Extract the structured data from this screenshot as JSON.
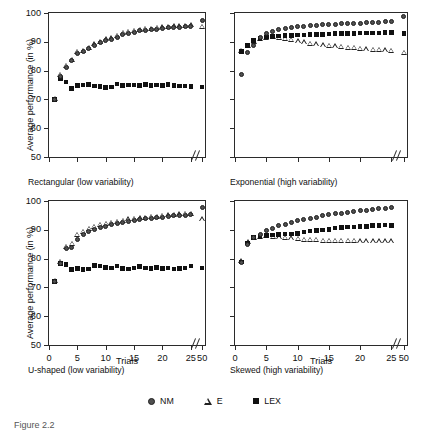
{
  "figure": {
    "caption": "Figure 2.2",
    "ylabel": "Average performance (in %)",
    "xlabel": "Trials"
  },
  "legend": {
    "position": "bottom-center",
    "items": [
      {
        "label": "NM",
        "marker": "filled-circle-icon"
      },
      {
        "label": "E",
        "marker": "open-triangle-icon"
      },
      {
        "label": "LEX",
        "marker": "filled-square-icon"
      }
    ]
  },
  "axes": {
    "ylim": [
      50,
      100
    ],
    "yticks": [
      50,
      60,
      70,
      80,
      90,
      100
    ],
    "yticklabels": [
      "50",
      "60",
      "70",
      "80",
      "90",
      "100"
    ],
    "xlim": [
      0,
      27.5
    ],
    "xticks": [
      0,
      5,
      10,
      15,
      20,
      25,
      27
    ],
    "xticklabels": [
      "0",
      "5",
      "10",
      "15",
      "20",
      "25",
      "50"
    ],
    "axis_break": true,
    "grid": false
  },
  "chart_data": [
    {
      "type": "scatter",
      "title": "Rectangular (low variability)",
      "panel": "top-left",
      "xlabel": "Trials",
      "ylabel": "Average performance (in %)",
      "ylim": [
        50,
        100
      ],
      "xticklabels": [
        "0",
        "5",
        "10",
        "15",
        "20",
        "25",
        "50"
      ],
      "x": [
        1,
        2,
        3,
        4,
        5,
        6,
        7,
        8,
        9,
        10,
        11,
        12,
        13,
        14,
        15,
        16,
        17,
        18,
        19,
        20,
        21,
        22,
        23,
        24,
        25,
        50
      ],
      "series": [
        {
          "name": "NM",
          "marker": "filled-circle",
          "values": [
            69.9,
            78.0,
            81.2,
            83.4,
            86.0,
            86.5,
            87.6,
            88.7,
            89.6,
            90.4,
            90.8,
            91.6,
            92.6,
            93.0,
            93.4,
            93.8,
            94.0,
            94.2,
            94.4,
            94.6,
            94.8,
            95.0,
            95.0,
            95.2,
            95.3,
            97.3
          ]
        },
        {
          "name": "E",
          "marker": "open-triangle",
          "values": [
            69.9,
            78.2,
            81.5,
            83.6,
            86.2,
            86.7,
            87.8,
            88.9,
            89.8,
            90.6,
            91.0,
            91.8,
            92.8,
            93.2,
            93.6,
            94.0,
            94.2,
            94.4,
            94.6,
            94.8,
            95.0,
            95.2,
            95.2,
            95.4,
            95.5,
            95.0
          ]
        },
        {
          "name": "LEX",
          "marker": "filled-square",
          "values": [
            69.9,
            77.3,
            76.0,
            73.8,
            74.8,
            75.0,
            75.1,
            74.6,
            74.4,
            74.2,
            74.3,
            75.3,
            74.8,
            75.0,
            75.0,
            74.9,
            75.1,
            74.8,
            75.0,
            74.9,
            75.1,
            74.8,
            74.6,
            74.6,
            74.5,
            74.3
          ]
        }
      ]
    },
    {
      "type": "scatter",
      "title": "Exponential (high variability)",
      "panel": "top-right",
      "xlabel": "Trials",
      "ylim": [
        50,
        100
      ],
      "xticklabels": [
        "0",
        "5",
        "10",
        "15",
        "20",
        "25",
        "50"
      ],
      "x": [
        1,
        2,
        3,
        4,
        5,
        6,
        7,
        8,
        9,
        10,
        11,
        12,
        13,
        14,
        15,
        16,
        17,
        18,
        19,
        20,
        21,
        22,
        23,
        24,
        25,
        50
      ],
      "series": [
        {
          "name": "NM",
          "marker": "filled-circle",
          "values": [
            78.6,
            86.3,
            88.8,
            91.4,
            92.8,
            93.6,
            94.2,
            94.6,
            95.0,
            95.2,
            95.4,
            95.6,
            95.8,
            95.9,
            96.0,
            96.1,
            96.2,
            96.3,
            96.4,
            96.5,
            96.6,
            96.7,
            96.8,
            96.9,
            97.0,
            98.8
          ]
        },
        {
          "name": "E",
          "marker": "open-triangle",
          "values": [
            86.5,
            88.5,
            89.8,
            90.8,
            91.2,
            91.4,
            91.2,
            90.8,
            90.4,
            90.0,
            89.6,
            89.2,
            88.9,
            88.6,
            88.4,
            88.2,
            88.0,
            87.8,
            87.6,
            87.4,
            87.2,
            87.0,
            86.9,
            86.8,
            86.7,
            86.0
          ]
        },
        {
          "name": "LEX",
          "marker": "filled-square",
          "values": [
            86.6,
            88.8,
            90.4,
            91.2,
            91.6,
            91.8,
            92.0,
            92.1,
            92.2,
            92.3,
            92.4,
            92.5,
            92.6,
            92.6,
            92.7,
            92.8,
            92.8,
            92.9,
            92.9,
            93.0,
            93.0,
            93.1,
            93.1,
            93.2,
            93.2,
            92.9
          ]
        }
      ]
    },
    {
      "type": "scatter",
      "title": "U-shaped (low variability)",
      "panel": "bottom-left",
      "xlabel": "Trials",
      "ylabel": "Average performance (in %)",
      "ylim": [
        50,
        100
      ],
      "xticklabels": [
        "0",
        "5",
        "10",
        "15",
        "20",
        "25",
        "50"
      ],
      "x": [
        1,
        2,
        3,
        4,
        5,
        6,
        7,
        8,
        9,
        10,
        11,
        12,
        13,
        14,
        15,
        16,
        17,
        18,
        19,
        20,
        21,
        22,
        23,
        24,
        25,
        50
      ],
      "series": [
        {
          "name": "NM",
          "marker": "filled-circle",
          "values": [
            72.0,
            78.4,
            83.4,
            84.0,
            86.8,
            88.2,
            89.4,
            90.2,
            90.8,
            91.2,
            91.8,
            92.2,
            92.6,
            93.0,
            93.4,
            93.6,
            93.8,
            94.0,
            94.2,
            94.4,
            94.6,
            94.8,
            95.0,
            95.1,
            95.2,
            97.7
          ]
        },
        {
          "name": "E",
          "marker": "open-triangle",
          "values": [
            72.0,
            78.6,
            83.8,
            85.0,
            88.0,
            89.0,
            90.2,
            90.8,
            91.4,
            91.8,
            92.2,
            92.6,
            93.0,
            93.4,
            93.6,
            93.8,
            94.0,
            94.2,
            94.4,
            94.6,
            94.8,
            95.0,
            95.2,
            95.3,
            95.4,
            93.4
          ]
        },
        {
          "name": "LEX",
          "marker": "filled-square",
          "values": [
            72.0,
            78.4,
            78.0,
            76.2,
            76.6,
            76.2,
            76.4,
            77.6,
            77.4,
            77.0,
            76.8,
            77.4,
            76.6,
            76.4,
            76.8,
            77.2,
            76.8,
            76.6,
            77.0,
            76.6,
            76.8,
            76.4,
            76.6,
            76.8,
            77.4,
            76.8
          ]
        }
      ]
    },
    {
      "type": "scatter",
      "title": "Skewed (high variability)",
      "panel": "bottom-right",
      "xlabel": "Trials",
      "ylim": [
        50,
        100
      ],
      "xticklabels": [
        "0",
        "5",
        "10",
        "15",
        "20",
        "25",
        "50"
      ],
      "x": [
        1,
        2,
        3,
        4,
        5,
        6,
        7,
        8,
        9,
        10,
        11,
        12,
        13,
        14,
        15,
        16,
        17,
        18,
        19,
        20,
        21,
        22,
        23,
        24,
        25
      ],
      "series": [
        {
          "name": "NM",
          "marker": "filled-circle",
          "values": [
            78.8,
            85.0,
            87.4,
            88.2,
            89.6,
            90.6,
            91.4,
            92.0,
            92.6,
            93.2,
            93.6,
            94.0,
            94.4,
            94.8,
            95.2,
            95.6,
            95.8,
            96.0,
            96.3,
            96.6,
            96.8,
            97.0,
            97.3,
            97.5,
            97.7
          ]
        },
        {
          "name": "E",
          "marker": "open-triangle",
          "values": [
            78.8,
            85.4,
            87.0,
            87.4,
            87.6,
            87.4,
            87.2,
            87.0,
            86.8,
            86.6,
            86.4,
            86.2,
            86.2,
            86.0,
            86.0,
            86.0,
            85.9,
            85.9,
            85.9,
            85.8,
            85.8,
            85.8,
            85.8,
            85.8,
            85.8
          ]
        },
        {
          "name": "LEX",
          "marker": "filled-square",
          "values": [
            78.8,
            85.4,
            87.4,
            87.6,
            88.0,
            88.2,
            88.4,
            88.6,
            88.6,
            88.8,
            89.2,
            89.6,
            89.8,
            90.0,
            90.2,
            90.6,
            90.8,
            91.0,
            91.0,
            91.2,
            91.2,
            91.4,
            91.5,
            91.6,
            91.4
          ]
        }
      ]
    }
  ]
}
